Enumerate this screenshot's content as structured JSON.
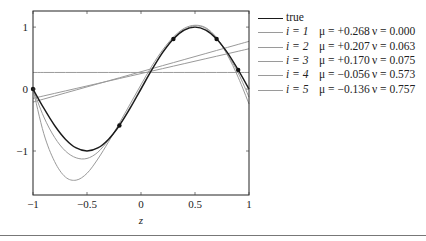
{
  "chart_data": {
    "type": "line",
    "title": "",
    "xlabel": "z",
    "ylabel": "",
    "xlim": [
      -1,
      1
    ],
    "ylim": [
      -1.71,
      1.26
    ],
    "grid": false,
    "legend_position": "right-outside",
    "x_ticks": [
      -1,
      -0.5,
      0,
      0.5,
      1
    ],
    "x_tick_labels": [
      "−1",
      "−0.5",
      "0",
      "0.5",
      "1"
    ],
    "y_ticks": [
      -1,
      0,
      1
    ],
    "y_tick_labels": [
      "−1",
      "0",
      "1"
    ],
    "sample_z": [
      -1,
      -0.9,
      -0.8,
      -0.7,
      -0.6,
      -0.5,
      -0.4,
      -0.3,
      -0.2,
      -0.1,
      0,
      0.1,
      0.2,
      0.3,
      0.4,
      0.5,
      0.6,
      0.7,
      0.8,
      0.9,
      1
    ],
    "series": [
      {
        "name": "true",
        "label": "true",
        "color": "#1a1a1a",
        "width": 1.4,
        "values": [
          0,
          -0.309,
          -0.588,
          -0.809,
          -0.951,
          -1.0,
          -0.951,
          -0.809,
          -0.588,
          -0.309,
          0,
          0.309,
          0.588,
          0.809,
          0.951,
          1.0,
          0.951,
          0.809,
          0.588,
          0.309,
          0
        ]
      },
      {
        "name": "i=1",
        "i": "i = 1",
        "mu": "μ = +0.268",
        "nu": "ν = 0.000",
        "color": "#9a9a9a",
        "width": 1,
        "values": [
          0.268,
          0.268,
          0.268,
          0.268,
          0.268,
          0.268,
          0.268,
          0.268,
          0.268,
          0.268,
          0.268,
          0.268,
          0.268,
          0.268,
          0.268,
          0.268,
          0.268,
          0.268,
          0.268,
          0.268,
          0.268
        ]
      },
      {
        "name": "i=2",
        "i": "i = 2",
        "mu": "μ = +0.207",
        "nu": "ν = 0.063",
        "color": "#9a9a9a",
        "width": 1,
        "values": [
          -0.21,
          -0.161,
          -0.112,
          -0.063,
          -0.014,
          0.035,
          0.084,
          0.133,
          0.182,
          0.231,
          0.28,
          0.329,
          0.378,
          0.427,
          0.476,
          0.525,
          0.574,
          0.623,
          0.672,
          0.721,
          0.77
        ]
      },
      {
        "name": "i=3",
        "i": "i = 3",
        "mu": "μ = +0.170",
        "nu": "ν = 0.075",
        "color": "#9a9a9a",
        "width": 1,
        "values": [
          -0.15,
          -0.11,
          -0.07,
          -0.03,
          0.01,
          0.05,
          0.09,
          0.13,
          0.17,
          0.21,
          0.25,
          0.29,
          0.33,
          0.37,
          0.41,
          0.45,
          0.49,
          0.53,
          0.57,
          0.61,
          0.65
        ]
      },
      {
        "name": "i=4",
        "i": "i = 4",
        "mu": "μ = −0.056",
        "nu": "ν = 0.573",
        "color": "#9a9a9a",
        "width": 1,
        "values": [
          0,
          -0.45,
          -0.78,
          -1.0,
          -1.11,
          -1.12,
          -1.02,
          -0.82,
          -0.58,
          -0.29,
          0.02,
          0.32,
          0.6,
          0.82,
          0.96,
          1.02,
          0.98,
          0.82,
          0.56,
          0.26,
          -0.13
        ]
      },
      {
        "name": "i=5",
        "i": "i = 5",
        "mu": "μ = −0.136",
        "nu": "ν = 0.757",
        "color": "#9a9a9a",
        "width": 1,
        "values": [
          0,
          -0.72,
          -1.17,
          -1.42,
          -1.47,
          -1.36,
          -1.13,
          -0.85,
          -0.55,
          -0.24,
          0.07,
          0.37,
          0.63,
          0.84,
          0.98,
          1.03,
          0.99,
          0.83,
          0.55,
          0.19,
          -0.24
        ]
      }
    ],
    "observations": [
      {
        "z": -1.0,
        "y": 0.0
      },
      {
        "z": -0.2,
        "y": -0.588
      },
      {
        "z": 0.3,
        "y": 0.809
      },
      {
        "z": 0.7,
        "y": 0.809
      },
      {
        "z": 0.9,
        "y": 0.309
      }
    ]
  },
  "legend": {
    "true_label": "true",
    "rows": [
      {
        "i": "i = 1",
        "mu": "μ = +0.268",
        "nu": "ν = 0.000"
      },
      {
        "i": "i = 2",
        "mu": "μ = +0.207",
        "nu": "ν = 0.063"
      },
      {
        "i": "i = 3",
        "mu": "μ = +0.170",
        "nu": "ν = 0.075"
      },
      {
        "i": "i = 4",
        "mu": "μ = −0.056",
        "nu": "ν = 0.573"
      },
      {
        "i": "i = 5",
        "mu": "μ = −0.136",
        "nu": "ν = 0.757"
      }
    ]
  }
}
